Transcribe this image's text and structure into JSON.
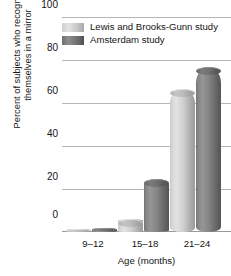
{
  "chart_data": {
    "type": "bar",
    "title": "",
    "subtitle": "",
    "xlabel": "Age (months)",
    "ylabel": "Percent of subjects who recognized themselves in a mirror",
    "ylabel_lines": [
      "Percent of subjects who recognized",
      "themselves in a mirror"
    ],
    "categories": [
      "9–12",
      "15–18",
      "21–24"
    ],
    "series": [
      {
        "name": "Lewis and Brooks-Gunn study",
        "color": "#cfcfcf",
        "values": [
          1,
          6,
          67
        ]
      },
      {
        "name": "Amsterdam study",
        "color": "#6f6f6f",
        "values": [
          2,
          25,
          77
        ]
      }
    ],
    "ylim": [
      0,
      100
    ],
    "yticks": [
      0,
      20,
      40,
      60,
      80,
      100
    ],
    "ytick_labels": [
      "0",
      "20",
      "40",
      "60",
      "80",
      "100"
    ],
    "grid": true,
    "grid_axis": "y",
    "legend_position": "top-left-inside",
    "bar_style": "cylinder-3d",
    "background": "#ffffff"
  },
  "legend": {
    "items": [
      {
        "label": "Lewis and Brooks-Gunn study",
        "swatch": "light"
      },
      {
        "label": "Amsterdam study",
        "swatch": "dark"
      }
    ]
  },
  "axes": {
    "y": {
      "ticks": [
        "100",
        "80",
        "60",
        "40",
        "20",
        "0"
      ]
    },
    "x": {
      "ticks": [
        "9–12",
        "15–18",
        "21–24"
      ],
      "title": "Age (months)"
    }
  }
}
